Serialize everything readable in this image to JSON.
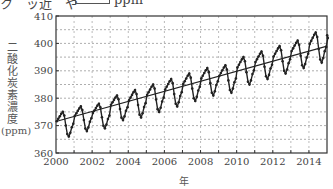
{
  "header": {
    "fragment_left": "ク　ッ近　や",
    "unit": "ppm"
  },
  "chart_data": {
    "type": "line",
    "title": "",
    "xlabel": "年",
    "ylabel": "二酸化炭素濃度",
    "ylabel_unit": "(ppm)",
    "xlim": [
      2000,
      2015
    ],
    "ylim": [
      360,
      410
    ],
    "x_ticks": [
      "2000",
      "2002",
      "2004",
      "2006",
      "2008",
      "2010",
      "2012",
      "2014"
    ],
    "y_ticks": [
      "360",
      "370",
      "380",
      "390",
      "400",
      "410"
    ],
    "grid": true,
    "grid_style": "dashed, major every 10 ppm and 1 year, minor every 5 ppm",
    "legend": null,
    "series": [
      {
        "name": "monthly CO2 concentration",
        "style": "black line with dot markers",
        "years": [
          2000,
          2001,
          2002,
          2003,
          2004,
          2005,
          2006,
          2007,
          2008,
          2009,
          2010,
          2011,
          2012,
          2013,
          2014
        ],
        "peaks": [
          375,
          377,
          378,
          381,
          383,
          385,
          387,
          389,
          391,
          392,
          395,
          397,
          399,
          401,
          404
        ],
        "troughs": [
          366,
          368,
          369,
          372,
          373,
          375,
          377,
          379,
          381,
          382,
          385,
          387,
          389,
          391,
          393
        ],
        "end_value": 403
      },
      {
        "name": "trend line",
        "style": "thin black straight line",
        "x": [
          2000,
          2015
        ],
        "values": [
          371.5,
          399
        ]
      }
    ]
  },
  "axis": {
    "xlabel": "年",
    "ylabel_chars": [
      "二",
      "酸",
      "化",
      "炭",
      "素",
      "濃",
      "度"
    ],
    "ylabel_unit": "(ppm)"
  }
}
